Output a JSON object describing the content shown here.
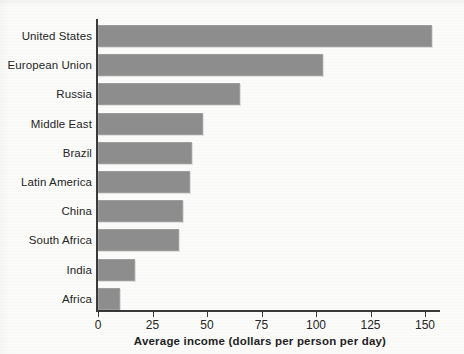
{
  "chart_data": {
    "type": "bar",
    "orientation": "horizontal",
    "title": "",
    "xlabel": "Average income (dollars per person per day)",
    "ylabel": "",
    "categories": [
      "United States",
      "European Union",
      "Russia",
      "Middle East",
      "Brazil",
      "Latin America",
      "China",
      "South Africa",
      "India",
      "Africa"
    ],
    "values": [
      153,
      103,
      65,
      48,
      43,
      42,
      39,
      37,
      17,
      10
    ],
    "xlim": [
      0,
      150
    ],
    "xticks": [
      0,
      25,
      50,
      75,
      100,
      125,
      150
    ],
    "xtick_labels": [
      "0",
      "25",
      "50",
      "75",
      "100",
      "125",
      "150"
    ],
    "grid": false,
    "legend": false,
    "bar_color": "#8d8d8d",
    "axis_color": "#3a3a3a",
    "background_color": "#fbfbfa"
  },
  "axis": {
    "x_title": "Average income (dollars per person per day)"
  }
}
